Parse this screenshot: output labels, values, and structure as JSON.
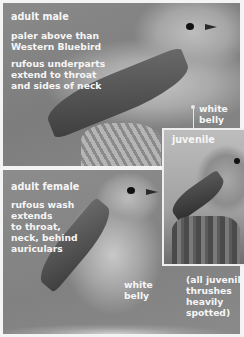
{
  "top_panel": {
    "title": "adult male",
    "note_1": [
      "paler above than",
      "Western Bluebird"
    ],
    "note_2": [
      "rufous underparts",
      "extend to throat",
      "and sides of neck"
    ],
    "callout": [
      "white",
      "belly"
    ]
  },
  "inset": {
    "title": "juvenile"
  },
  "bottom_panel": {
    "title": "adult female",
    "note_1": [
      "rufous wash",
      "extends",
      "to throat,",
      "neck, behind",
      "auriculars"
    ],
    "callout": [
      "white",
      "belly"
    ],
    "juvenile_note": [
      "(all juvenile",
      "thrushes",
      "heavily",
      "spotted)"
    ]
  },
  "colors": {
    "label_text": "#f6f6f6",
    "page_bg": "#f4f4f4",
    "panel_bg": "#858585"
  }
}
